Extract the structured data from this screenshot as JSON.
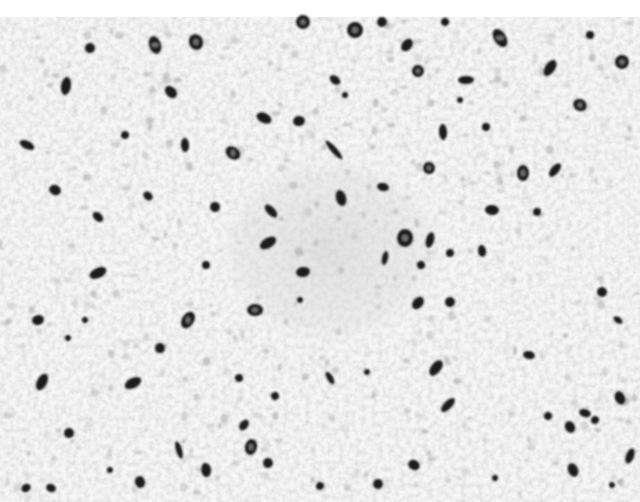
{
  "image": {
    "kind": "grayscale immunohistochemistry micrograph",
    "width": 640,
    "height": 502,
    "top_margin_px": 17,
    "colors": {
      "background": "#ffffff",
      "tissue_light": "#f2f2f2",
      "tissue_mid": "#d9d9d9",
      "stain_dark": "#1a1a1a",
      "stain_core": "#6e6e6e"
    },
    "central_cluster": {
      "cx": 330,
      "cy": 250,
      "rx": 130,
      "ry": 110
    },
    "stained_cells": [
      [
        155,
        45,
        9,
        6
      ],
      [
        196,
        42,
        7,
        8
      ],
      [
        90,
        48,
        5,
        5
      ],
      [
        66,
        86,
        9,
        5
      ],
      [
        171,
        92,
        5,
        7
      ],
      [
        303,
        22,
        7,
        7
      ],
      [
        355,
        30,
        8,
        8
      ],
      [
        382,
        22,
        5,
        5
      ],
      [
        407,
        45,
        7,
        5
      ],
      [
        445,
        22,
        4,
        4
      ],
      [
        500,
        38,
        10,
        6
      ],
      [
        550,
        68,
        9,
        5
      ],
      [
        590,
        35,
        4,
        4
      ],
      [
        622,
        62,
        7,
        7
      ],
      [
        418,
        71,
        6,
        6
      ],
      [
        335,
        80,
        6,
        4
      ],
      [
        466,
        80,
        4,
        8
      ],
      [
        580,
        105,
        6,
        7
      ],
      [
        264,
        118,
        5,
        8
      ],
      [
        299,
        121,
        6,
        5
      ],
      [
        233,
        153,
        6,
        8
      ],
      [
        334,
        150,
        3,
        12
      ],
      [
        443,
        132,
        4,
        8
      ],
      [
        429,
        168,
        6,
        6
      ],
      [
        486,
        127,
        4,
        4
      ],
      [
        523,
        173,
        6,
        8
      ],
      [
        555,
        170,
        4,
        8
      ],
      [
        492,
        210,
        5,
        7
      ],
      [
        537,
        212,
        4,
        4
      ],
      [
        185,
        145,
        4,
        7
      ],
      [
        125,
        135,
        4,
        4
      ],
      [
        27,
        145,
        4,
        8
      ],
      [
        55,
        190,
        6,
        5
      ],
      [
        98,
        217,
        6,
        4
      ],
      [
        148,
        196,
        5,
        4
      ],
      [
        215,
        207,
        5,
        5
      ],
      [
        271,
        211,
        4,
        8
      ],
      [
        341,
        198,
        5,
        8
      ],
      [
        383,
        187,
        4,
        6
      ],
      [
        405,
        238,
        8,
        9
      ],
      [
        430,
        240,
        4,
        8
      ],
      [
        268,
        243,
        5,
        9
      ],
      [
        303,
        272,
        5,
        7
      ],
      [
        450,
        253,
        4,
        4
      ],
      [
        482,
        251,
        6,
        4
      ],
      [
        421,
        265,
        4,
        4
      ],
      [
        385,
        258,
        3,
        7
      ],
      [
        206,
        265,
        4,
        4
      ],
      [
        98,
        273,
        9,
        5
      ],
      [
        38,
        320,
        5,
        6
      ],
      [
        85,
        320,
        3,
        3
      ],
      [
        188,
        320,
        6,
        9
      ],
      [
        255,
        310,
        8,
        6
      ],
      [
        300,
        300,
        3,
        3
      ],
      [
        418,
        303,
        7,
        5
      ],
      [
        450,
        302,
        5,
        5
      ],
      [
        602,
        292,
        5,
        5
      ],
      [
        618,
        320,
        3,
        5
      ],
      [
        529,
        355,
        4,
        6
      ],
      [
        436,
        368,
        5,
        9
      ],
      [
        330,
        378,
        7,
        3
      ],
      [
        160,
        348,
        5,
        5
      ],
      [
        68,
        338,
        3,
        3
      ],
      [
        42,
        382,
        5,
        9
      ],
      [
        133,
        383,
        9,
        5
      ],
      [
        239,
        378,
        4,
        4
      ],
      [
        275,
        396,
        4,
        4
      ],
      [
        367,
        372,
        3,
        3
      ],
      [
        448,
        405,
        4,
        9
      ],
      [
        595,
        420,
        4,
        4
      ],
      [
        585,
        413,
        4,
        6
      ],
      [
        570,
        427,
        5,
        6
      ],
      [
        630,
        456,
        4,
        8
      ],
      [
        620,
        398,
        5,
        7
      ],
      [
        548,
        416,
        4,
        4
      ],
      [
        573,
        470,
        7,
        5
      ],
      [
        414,
        465,
        5,
        6
      ],
      [
        378,
        484,
        5,
        5
      ],
      [
        251,
        447,
        6,
        8
      ],
      [
        244,
        425,
        4,
        6
      ],
      [
        268,
        463,
        5,
        5
      ],
      [
        206,
        470,
        5,
        7
      ],
      [
        179,
        450,
        3,
        9
      ],
      [
        140,
        482,
        5,
        6
      ],
      [
        69,
        433,
        5,
        5
      ],
      [
        51,
        488,
        4,
        5
      ],
      [
        26,
        488,
        4,
        5
      ],
      [
        110,
        470,
        3,
        3
      ],
      [
        320,
        486,
        4,
        4
      ],
      [
        495,
        478,
        3,
        3
      ],
      [
        612,
        485,
        3,
        3
      ],
      [
        345,
        95,
        3,
        3
      ],
      [
        460,
        100,
        3,
        3
      ]
    ]
  }
}
